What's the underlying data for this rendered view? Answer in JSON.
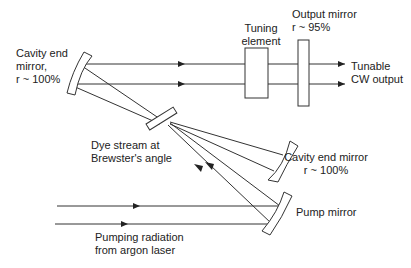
{
  "diagram": {
    "title": "",
    "labels": {
      "left_mirror": "Cavity end\nmirror,\nr ~ 100%",
      "tuning_element": "Tuning\nelement",
      "output_mirror": "Output mirror\nr ~ 95%",
      "output": "Tunable\nCW output",
      "dye_stream": "Dye stream at\nBrewster's angle",
      "right_mirror": "Cavity end mirror\nr ~ 100%",
      "pump_mirror": "Pump mirror",
      "pump_source": "Pumping radiation\nfrom argon laser"
    },
    "colors": {
      "line": "#333333",
      "background": "#ffffff"
    }
  }
}
